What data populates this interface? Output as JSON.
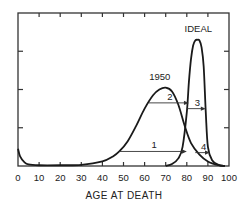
{
  "chart_data": {
    "type": "line",
    "title": "",
    "xlabel": "AGE AT DEATH",
    "ylabel": "",
    "xlim": [
      0,
      100
    ],
    "ylim": [
      0,
      4
    ],
    "grid": false,
    "x_ticks": [
      0,
      10,
      20,
      30,
      40,
      50,
      60,
      70,
      80,
      90,
      100
    ],
    "x_tick_labels": [
      "0",
      "10",
      "20",
      "30",
      "40",
      "50",
      "60",
      "70",
      "80",
      "90",
      "100"
    ],
    "y_ticks": [
      1,
      2,
      3
    ],
    "series": [
      {
        "name": "1950",
        "label_text": "1950",
        "points": [
          [
            0,
            0.45
          ],
          [
            1,
            0.25
          ],
          [
            3,
            0.1
          ],
          [
            5,
            0.04
          ],
          [
            10,
            0.02
          ],
          [
            20,
            0.02
          ],
          [
            30,
            0.03
          ],
          [
            40,
            0.12
          ],
          [
            45,
            0.25
          ],
          [
            48,
            0.38
          ],
          [
            52,
            0.65
          ],
          [
            56,
            1.05
          ],
          [
            60,
            1.5
          ],
          [
            64,
            1.85
          ],
          [
            67,
            2.0
          ],
          [
            70,
            2.05
          ],
          [
            73,
            1.95
          ],
          [
            76,
            1.6
          ],
          [
            79,
            1.05
          ],
          [
            82,
            0.6
          ],
          [
            86,
            0.3
          ],
          [
            90,
            0.12
          ],
          [
            95,
            0.02
          ],
          [
            98,
            0
          ]
        ]
      },
      {
        "name": "IDEAL",
        "label_text": "IDEAL",
        "points": [
          [
            70,
            0
          ],
          [
            73,
            0.05
          ],
          [
            76,
            0.2
          ],
          [
            78,
            0.5
          ],
          [
            80,
            1.4
          ],
          [
            81,
            2.2
          ],
          [
            82,
            2.8
          ],
          [
            83,
            3.15
          ],
          [
            84,
            3.28
          ],
          [
            85,
            3.3
          ],
          [
            86,
            3.28
          ],
          [
            87,
            3.1
          ],
          [
            88,
            2.6
          ],
          [
            89,
            1.4
          ],
          [
            90,
            0.5
          ],
          [
            92,
            0.15
          ],
          [
            95,
            0.03
          ],
          [
            98,
            0
          ]
        ]
      }
    ],
    "annotations": [
      {
        "label": "1",
        "from_x": 48,
        "to_x": 80,
        "y": 0.38
      },
      {
        "label": "2",
        "from_x": 62,
        "to_x": 81,
        "y": 1.65
      },
      {
        "label": "3",
        "from_x": 80,
        "to_x": 89,
        "y": 1.5
      },
      {
        "label": "4",
        "from_x": 84,
        "to_x": 91,
        "y": 0.35
      }
    ]
  }
}
